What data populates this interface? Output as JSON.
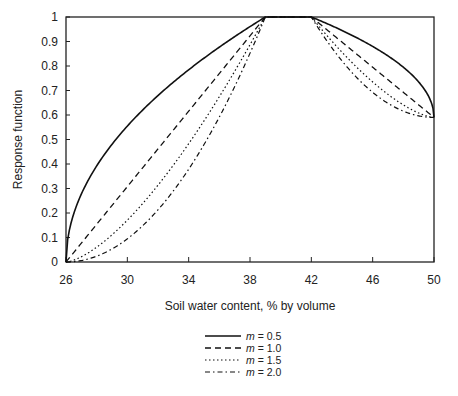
{
  "chart_data": {
    "type": "line",
    "title": "",
    "xlabel": "Soil water content, % by volume",
    "ylabel": "Response function",
    "xlim": [
      26,
      50
    ],
    "ylim": [
      0,
      1
    ],
    "xticks": [
      26,
      30,
      34,
      38,
      42,
      46,
      50
    ],
    "yticks": [
      0,
      0.1,
      0.2,
      0.3,
      0.4,
      0.5,
      0.6,
      0.7,
      0.8,
      0.9,
      1
    ],
    "ytick_labels": [
      "0",
      "0.1",
      "0.2",
      "0.3",
      "0.4",
      "0.5",
      "0.6",
      "0.7",
      "0.8",
      "0.9",
      "1"
    ],
    "grid": false,
    "legend_position": "bottom-center",
    "model": {
      "rise": {
        "x_start": 26,
        "x_end": 39,
        "y_start": 0,
        "y_end": 1
      },
      "plateau": {
        "x_start": 39,
        "x_end": 42,
        "y": 1
      },
      "fall": {
        "x_start": 42,
        "x_end": 50,
        "y_start": 1,
        "y_end": 0.59
      }
    },
    "series": [
      {
        "name": "m = 0.5",
        "m_label": "m",
        "m_value": "0.5",
        "m": 0.5,
        "style": "solid",
        "x": [
          26,
          26.5,
          27,
          28,
          30,
          32,
          34,
          36,
          38,
          39,
          42,
          44,
          46,
          48,
          49,
          50
        ],
        "y": [
          0,
          0.2,
          0.28,
          0.39,
          0.55,
          0.68,
          0.78,
          0.88,
          0.96,
          1,
          1,
          0.95,
          0.88,
          0.79,
          0.73,
          0.59
        ]
      },
      {
        "name": "m = 1.0",
        "m_label": "m",
        "m_value": "1.0",
        "m": 1.0,
        "style": "dashed",
        "x": [
          26,
          30,
          34,
          38,
          39,
          42,
          46,
          50
        ],
        "y": [
          0,
          0.31,
          0.62,
          0.92,
          1,
          1,
          0.8,
          0.59
        ]
      },
      {
        "name": "m = 1.5",
        "m_label": "m",
        "m_value": "1.5",
        "m": 1.5,
        "style": "dotted",
        "x": [
          26,
          30,
          34,
          38,
          39,
          42,
          46,
          50
        ],
        "y": [
          0,
          0.17,
          0.49,
          0.89,
          1,
          1,
          0.74,
          0.59
        ]
      },
      {
        "name": "m = 2.0",
        "m_label": "m",
        "m_value": "2.0",
        "m": 2.0,
        "style": "dash-dot",
        "x": [
          26,
          30,
          34,
          38,
          39,
          42,
          46,
          50
        ],
        "y": [
          0,
          0.09,
          0.38,
          0.85,
          1,
          1,
          0.69,
          0.59
        ]
      }
    ]
  }
}
